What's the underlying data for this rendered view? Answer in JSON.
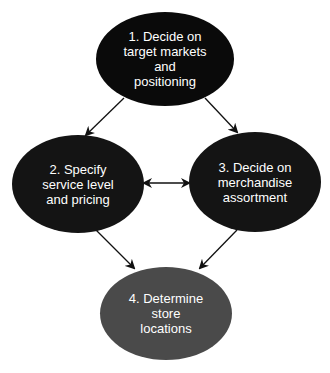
{
  "diagram": {
    "nodes": [
      {
        "id": "n1",
        "label": "1. Decide on\ntarget markets\nand\npositioning",
        "fill": "#0a0a0a"
      },
      {
        "id": "n2",
        "label": "2. Specify\nservice level\nand pricing",
        "fill": "#141414"
      },
      {
        "id": "n3",
        "label": "3. Decide on\nmerchandise\nassortment",
        "fill": "#141414"
      },
      {
        "id": "n4",
        "label": "4. Determine\nstore\nlocations",
        "fill": "#4a4a4a"
      }
    ],
    "edges": [
      {
        "from": "n1",
        "to": "n2",
        "type": "arrow"
      },
      {
        "from": "n1",
        "to": "n3",
        "type": "arrow"
      },
      {
        "from": "n2",
        "to": "n3",
        "type": "bidirectional"
      },
      {
        "from": "n2",
        "to": "n4",
        "type": "arrow"
      },
      {
        "from": "n3",
        "to": "n4",
        "type": "arrow"
      }
    ]
  }
}
